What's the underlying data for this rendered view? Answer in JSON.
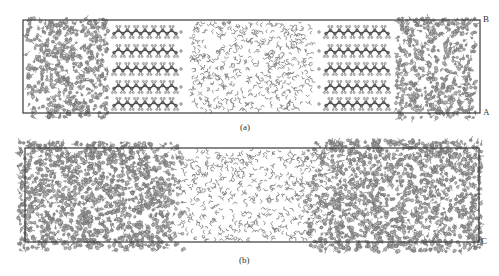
{
  "figure": {
    "width": 499,
    "height": 276,
    "colors": {
      "background": "#ffffff",
      "box_stroke": "#3a3a3a",
      "atom_fill": "#9a9a9a",
      "atom_stroke": "#4a4a4a",
      "bond": "#5a5a5a",
      "water": "#7a7a7a",
      "label": "#333333"
    }
  },
  "panels": [
    {
      "id": "a",
      "caption": "(a)",
      "caption_pos": [
        248,
        122
      ],
      "box": {
        "x": 23,
        "y": 20,
        "w": 457,
        "h": 93
      },
      "corner_labels": [
        {
          "text": "B",
          "x": 483,
          "y": 14
        },
        {
          "text": "A",
          "x": 483,
          "y": 107
        }
      ],
      "clusters": [
        {
          "name": "left-aggregate",
          "x0": 26,
          "x1": 108,
          "y0": 18,
          "y1": 118,
          "count": 520,
          "seed": 11
        },
        {
          "name": "right-aggregate",
          "x0": 396,
          "x1": 476,
          "y0": 18,
          "y1": 118,
          "count": 520,
          "seed": 23
        }
      ],
      "chains": [
        {
          "side": "left",
          "x0": 114,
          "x1": 176,
          "rows": [
            32,
            51,
            69,
            87,
            104
          ],
          "segments": 14,
          "end_dot_x": 181
        },
        {
          "side": "right",
          "x0": 326,
          "x1": 388,
          "rows": [
            32,
            51,
            69,
            87,
            104
          ],
          "segments": 14,
          "end_dot_x": 319
        }
      ],
      "water": {
        "x0": 190,
        "x1": 313,
        "y0": 22,
        "y1": 111,
        "count": 520,
        "seed": 37
      }
    },
    {
      "id": "b",
      "caption": "(b)",
      "caption_pos": [
        247,
        255
      ],
      "box": {
        "x": 25,
        "y": 148,
        "w": 454,
        "h": 94
      },
      "corner_labels": [
        {
          "text": "C",
          "x": 481,
          "y": 236
        }
      ],
      "clusters": [
        {
          "name": "left-adsorbed-layer",
          "x0": 18,
          "x1": 185,
          "y0": 142,
          "y1": 250,
          "count": 1500,
          "seed": 51,
          "taper_right": 30
        },
        {
          "name": "right-adsorbed-layer",
          "x0": 305,
          "x1": 482,
          "y0": 140,
          "y1": 252,
          "count": 1550,
          "seed": 67,
          "taper_left": 30
        }
      ],
      "chains": [],
      "water": {
        "x0": 180,
        "x1": 330,
        "y0": 150,
        "y1": 240,
        "count": 560,
        "seed": 79
      }
    }
  ]
}
